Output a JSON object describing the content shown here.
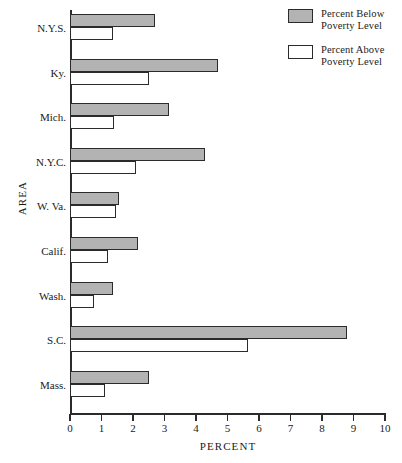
{
  "chart_data": {
    "type": "bar",
    "orientation": "horizontal",
    "title": "",
    "xlabel": "PERCENT",
    "ylabel": "AREA",
    "xlim": [
      0,
      10
    ],
    "xticks": [
      0,
      1,
      2,
      3,
      4,
      5,
      6,
      7,
      8,
      9,
      10
    ],
    "grid": false,
    "legend_position": "top-right",
    "categories": [
      "N.Y.S.",
      "Ky.",
      "Mich.",
      "N.Y.C.",
      "W. Va.",
      "Calif.",
      "Wash.",
      "S.C.",
      "Mass."
    ],
    "series": [
      {
        "name": "Percent Below\nPoverty Level",
        "color": "#b3b3b3",
        "values": [
          2.7,
          4.7,
          3.15,
          4.3,
          1.55,
          2.15,
          1.35,
          8.8,
          2.5
        ]
      },
      {
        "name": "Percent Above\nPoverty Level",
        "color": "#ffffff",
        "values": [
          1.35,
          2.5,
          1.4,
          2.1,
          1.45,
          1.2,
          0.75,
          5.65,
          1.1
        ]
      }
    ]
  },
  "legend": {
    "entries": [
      {
        "label": "Percent Below\nPoverty Level",
        "swatch": "below"
      },
      {
        "label": "Percent Above\nPoverty Level",
        "swatch": "above"
      }
    ]
  },
  "axes": {
    "x_title": "PERCENT",
    "y_title": "AREA"
  }
}
